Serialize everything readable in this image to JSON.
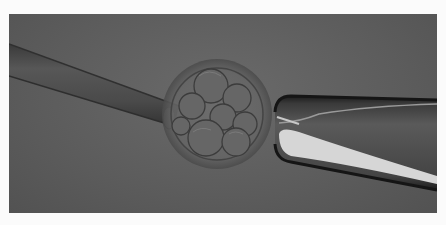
{
  "image": {
    "description": "Microscopy image of an embryo biopsy: a biopsy pipette enters from the left into a cleavage-stage embryo, which is held by a holding pipette on the right",
    "subjects": [
      "biopsy-pipette",
      "cleavage-stage-embryo",
      "holding-pipette"
    ],
    "colors": {
      "background": "#5c5c5c",
      "border": "#fbfbfb",
      "pipette_highlight": "#d8d8d8",
      "pipette_dark": "#1e1e1e"
    }
  }
}
